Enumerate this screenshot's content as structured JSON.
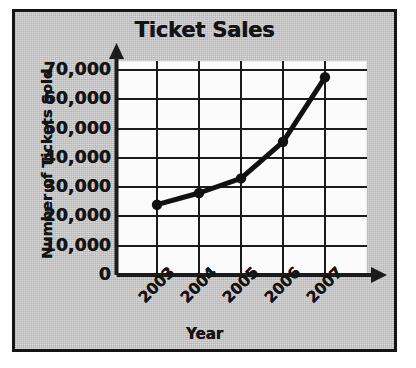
{
  "chart_data": {
    "type": "line",
    "title": "Ticket Sales",
    "xlabel": "Year",
    "ylabel": "Number of Tickets Sold",
    "categories": [
      "2003",
      "2004",
      "2005",
      "2006",
      "2007"
    ],
    "values": [
      24000,
      28000,
      33000,
      45500,
      67500
    ],
    "series": [
      {
        "name": "Tickets Sold",
        "values": [
          24000,
          28000,
          33000,
          45500,
          67500
        ]
      }
    ],
    "ylim": [
      0,
      70000
    ],
    "ytick_labels": [
      "70,000",
      "60,000",
      "50,000",
      "40,000",
      "30,000",
      "20,000",
      "10,000",
      "0"
    ],
    "ytick_values": [
      70000,
      60000,
      50000,
      40000,
      30000,
      20000,
      10000,
      0
    ],
    "ytick_step": 10000,
    "grid": true,
    "legend": false,
    "legend_position": "none",
    "marker": "circle",
    "line_color": "#111111",
    "marker_color": "#111111",
    "grid_color": "#1b1b1b",
    "plot_background": "#fbfbfb",
    "panel_background": "#c2c2c2",
    "text_color": "#141414"
  }
}
